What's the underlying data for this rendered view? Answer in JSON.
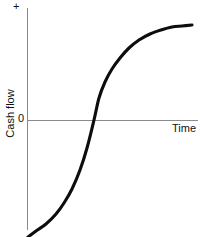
{
  "figure": {
    "background_color": "#ffffff",
    "axis_color": "#8a8a8a",
    "curve_color": "#0d0d0d"
  },
  "labels": {
    "positive_axis": "+",
    "zero": "0",
    "x_axis": "Time",
    "y_axis": "Cash flow"
  },
  "chart_data": {
    "type": "line",
    "title": "",
    "subtitle": "",
    "xlabel": "Time",
    "ylabel": "Cash flow",
    "grid": false,
    "legend": null,
    "annotations": [
      "+",
      "0"
    ],
    "xlim": [
      0,
      1
    ],
    "ylim": [
      -1.15,
      1.05
    ],
    "x_tick_labels": [],
    "y_tick_labels": [
      "+",
      "0"
    ],
    "series": [
      {
        "name": "Cumulative cash flow",
        "x": [
          0.0,
          0.05,
          0.1,
          0.15,
          0.2,
          0.25,
          0.3,
          0.35,
          0.4,
          0.45,
          0.5,
          0.55,
          0.6,
          0.65,
          0.7,
          0.75,
          0.8,
          0.85,
          0.9,
          0.95,
          1.0
        ],
        "y": [
          -1.12,
          -1.07,
          -1.0,
          -0.92,
          -0.82,
          -0.68,
          -0.49,
          -0.25,
          -0.02,
          0.18,
          0.34,
          0.47,
          0.58,
          0.67,
          0.74,
          0.8,
          0.85,
          0.88,
          0.91,
          0.93,
          0.94
        ]
      }
    ],
    "zero_crossing": {
      "x": 0.4,
      "y": 0.0
    },
    "path_points_px": [
      [
        28,
        237
      ],
      [
        36,
        231
      ],
      [
        46,
        224
      ],
      [
        56,
        214
      ],
      [
        64,
        203
      ],
      [
        72,
        189
      ],
      [
        80,
        170
      ],
      [
        87,
        148
      ],
      [
        94,
        120
      ],
      [
        99,
        98
      ],
      [
        105,
        82
      ],
      [
        112,
        69
      ],
      [
        120,
        58
      ],
      [
        129,
        48
      ],
      [
        139,
        40
      ],
      [
        150,
        34
      ],
      [
        161,
        30
      ],
      [
        172,
        27
      ],
      [
        182,
        26
      ],
      [
        192,
        25
      ]
    ]
  },
  "geometry": {
    "y_axis_x": 27.5,
    "y_axis_top": 8,
    "y_axis_bottom": 230,
    "x_axis_y": 120.5,
    "x_axis_left": 27.5,
    "x_axis_right": 198
  }
}
